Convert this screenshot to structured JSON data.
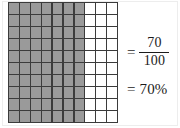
{
  "figure": {
    "background_color": "#ffffff",
    "frame_color": "#ededed"
  },
  "grid": {
    "name": "hundred-square",
    "rows": 10,
    "columns": 10,
    "total_cells": 100,
    "shaded_cells": 70,
    "unshaded_cells": 30,
    "shaded_columns": 7,
    "unshaded_columns": 3,
    "shaded_color": "#9a9a9a",
    "unshaded_color": "#ffffff",
    "line_color": "#3b3b3b"
  },
  "equations": {
    "fraction": {
      "equals_sign": "=",
      "numerator": "70",
      "denominator": "100"
    },
    "percent": {
      "equals_sign": "=",
      "value": "70%"
    }
  },
  "chart_data": {
    "type": "heatmap",
    "categories": [
      "shaded",
      "unshaded"
    ],
    "values": [
      70,
      30
    ],
    "grid_rows": 10,
    "grid_columns": 10,
    "shaded_per_row": 7,
    "unshaded_per_row": 3,
    "fraction": "70/100",
    "percent": "70%",
    "grid": [
      [
        1,
        1,
        1,
        1,
        1,
        1,
        1,
        0,
        0,
        0
      ],
      [
        1,
        1,
        1,
        1,
        1,
        1,
        1,
        0,
        0,
        0
      ],
      [
        1,
        1,
        1,
        1,
        1,
        1,
        1,
        0,
        0,
        0
      ],
      [
        1,
        1,
        1,
        1,
        1,
        1,
        1,
        0,
        0,
        0
      ],
      [
        1,
        1,
        1,
        1,
        1,
        1,
        1,
        0,
        0,
        0
      ],
      [
        1,
        1,
        1,
        1,
        1,
        1,
        1,
        0,
        0,
        0
      ],
      [
        1,
        1,
        1,
        1,
        1,
        1,
        1,
        0,
        0,
        0
      ],
      [
        1,
        1,
        1,
        1,
        1,
        1,
        1,
        0,
        0,
        0
      ],
      [
        1,
        1,
        1,
        1,
        1,
        1,
        1,
        0,
        0,
        0
      ],
      [
        1,
        1,
        1,
        1,
        1,
        1,
        1,
        0,
        0,
        0
      ]
    ],
    "legend": [],
    "xlabel": "",
    "ylabel": "",
    "grid_on": true
  }
}
